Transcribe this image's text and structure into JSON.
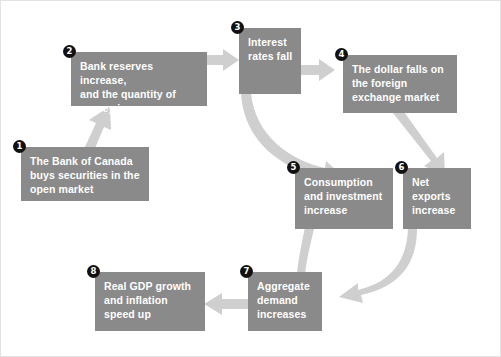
{
  "diagram": {
    "background_color": "#ffffff",
    "box_color": "#8a8a8a",
    "box_text_color": "#ffffff",
    "arrow_color": "#cfcfcf",
    "badge_color": "#111111",
    "nodes": [
      {
        "number": "1",
        "label": "The Bank of Canada buys securities in the open market",
        "lines": [
          "The Bank of Canada",
          "buys securities in the",
          "open market"
        ]
      },
      {
        "number": "2",
        "label": "Bank reserves increase, and the quantity of money increases",
        "lines": [
          "Bank reserves increase,",
          "and the quantity of",
          "money increases"
        ]
      },
      {
        "number": "3",
        "label": "Interest rates fall",
        "lines": [
          "Interest",
          "rates fall"
        ]
      },
      {
        "number": "4",
        "label": "The dollar falls on the foreign exchange market",
        "lines": [
          "The dollar falls on",
          "the foreign",
          "exchange market"
        ]
      },
      {
        "number": "5",
        "label": "Consumption and investment increase",
        "lines": [
          "Consumption",
          "and investment",
          "increase"
        ]
      },
      {
        "number": "6",
        "label": "Net exports increase",
        "lines": [
          "Net",
          "exports",
          "increase"
        ]
      },
      {
        "number": "7",
        "label": "Aggregate demand increases",
        "lines": [
          "Aggregate",
          "demand",
          "increases"
        ]
      },
      {
        "number": "8",
        "label": "Real GDP growth and inflation speed up",
        "lines": [
          "Real GDP growth",
          "and inflation",
          "speed up"
        ]
      }
    ],
    "connections": [
      {
        "from": "1",
        "to": "2",
        "style": "diagonal-up-right"
      },
      {
        "from": "2",
        "to": "3",
        "style": "straight-right"
      },
      {
        "from": "3",
        "to": "4",
        "style": "straight-right"
      },
      {
        "from": "3",
        "to": "5",
        "style": "curved-down"
      },
      {
        "from": "4",
        "to": "6",
        "style": "diagonal-down"
      },
      {
        "from": "5",
        "to": "7",
        "style": "curved-down-right"
      },
      {
        "from": "6",
        "to": "7",
        "style": "curved-down-left"
      },
      {
        "from": "7",
        "to": "8",
        "style": "straight-left"
      }
    ]
  }
}
